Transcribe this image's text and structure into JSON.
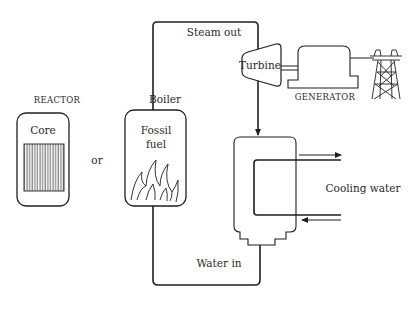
{
  "diagram": {
    "type": "power-plant-schematic",
    "reactor": {
      "title": "REACTOR",
      "core_label": "Core"
    },
    "alternative_connector": "or",
    "boiler": {
      "label": "Boiler",
      "fuel_label_line1": "Fossil",
      "fuel_label_line2": "fuel"
    },
    "loop": {
      "top_label": "Steam out",
      "bottom_label": "Water in"
    },
    "turbine": {
      "label": "Turbine"
    },
    "generator": {
      "label": "GENERATOR"
    },
    "condenser": {
      "cooling_label": "Cooling water"
    },
    "colors": {
      "line": "#1f1f1f",
      "text": "#2a2a2a",
      "background": "#ffffff"
    }
  }
}
